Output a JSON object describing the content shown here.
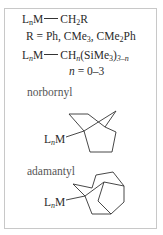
{
  "diagram": {
    "formula1": {
      "ligand": "L",
      "ligand_sub": "n",
      "metal": "M",
      "group": "CH",
      "group_sub": "2",
      "group_tail": "R"
    },
    "r_definition": {
      "prefix": "R = Ph, CMe",
      "sub1": "3",
      "mid": ", CMe",
      "sub2": "2",
      "tail": "Ph"
    },
    "formula2": {
      "ligand": "L",
      "ligand_sub": "n",
      "metal": "M",
      "group": "CH",
      "group_sub": "n",
      "paren": "(SiMe",
      "paren_sub": "3",
      "close": ")",
      "outer_sub": "3–n"
    },
    "n_range": {
      "var": "n",
      "text": " = 0–3"
    },
    "norbornyl": {
      "label": "norbornyl",
      "attach_ligand": "L",
      "attach_sub": "n",
      "attach_metal": "M"
    },
    "adamantyl": {
      "label": "adamantyl",
      "attach_ligand": "L",
      "attach_sub": "n",
      "attach_metal": "M"
    }
  }
}
